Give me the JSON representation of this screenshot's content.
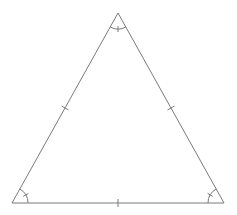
{
  "diagram": {
    "type": "equilateral-triangle",
    "stroke_color": "#7a7a7a",
    "background": "#ffffff",
    "vertices": {
      "apex": [
        118,
        13
      ],
      "bottom_left": [
        12,
        203
      ],
      "bottom_right": [
        224,
        203
      ]
    },
    "side_tick_marks": 1,
    "angle_arc_marks": 1,
    "angle_arc_tick": true,
    "labels": []
  }
}
